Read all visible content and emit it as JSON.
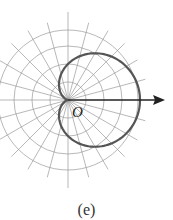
{
  "figure": {
    "caption": "(e)",
    "origin_label": "O",
    "curve": "cardioid r = a(1 + cos θ)",
    "colors": {
      "grid": "#9a9a9a",
      "curve": "#555555",
      "axis": "#222222"
    }
  }
}
